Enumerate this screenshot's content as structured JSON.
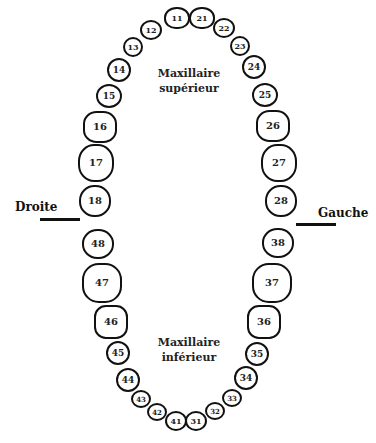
{
  "diagram": {
    "type": "dental-chart",
    "labels": {
      "upper_jaw_line1": "Maxillaire",
      "upper_jaw_line2": "supérieur",
      "lower_jaw_line1": "Maxillaire",
      "lower_jaw_line2": "inférieur",
      "right_side": "Droite",
      "left_side": "Gauche"
    },
    "colors": {
      "outline": "#111111",
      "text": "#222222",
      "background": "#ffffff"
    },
    "upper_teeth": [
      {
        "num": "11",
        "x": 177,
        "y": 18,
        "w": 26,
        "h": 22,
        "r": "48% 48% 45% 45%"
      },
      {
        "num": "21",
        "x": 202,
        "y": 18,
        "w": 26,
        "h": 22,
        "r": "48% 48% 45% 45%"
      },
      {
        "num": "12",
        "x": 151,
        "y": 30,
        "w": 22,
        "h": 20,
        "r": "50%"
      },
      {
        "num": "22",
        "x": 224,
        "y": 28,
        "w": 22,
        "h": 20,
        "r": "50%"
      },
      {
        "num": "13",
        "x": 133,
        "y": 47,
        "w": 20,
        "h": 20,
        "r": "50%"
      },
      {
        "num": "23",
        "x": 240,
        "y": 46,
        "w": 20,
        "h": 20,
        "r": "50%"
      },
      {
        "num": "14",
        "x": 119,
        "y": 70,
        "w": 24,
        "h": 24,
        "r": "50%"
      },
      {
        "num": "24",
        "x": 254,
        "y": 67,
        "w": 24,
        "h": 24,
        "r": "50%"
      },
      {
        "num": "15",
        "x": 109,
        "y": 96,
        "w": 26,
        "h": 24,
        "r": "50%"
      },
      {
        "num": "25",
        "x": 265,
        "y": 95,
        "w": 26,
        "h": 24,
        "r": "50%"
      },
      {
        "num": "16",
        "x": 100,
        "y": 127,
        "w": 34,
        "h": 32,
        "r": "40%"
      },
      {
        "num": "26",
        "x": 273,
        "y": 126,
        "w": 34,
        "h": 32,
        "r": "40%"
      },
      {
        "num": "17",
        "x": 96,
        "y": 163,
        "w": 36,
        "h": 38,
        "r": "45%"
      },
      {
        "num": "27",
        "x": 279,
        "y": 163,
        "w": 36,
        "h": 38,
        "r": "45%"
      },
      {
        "num": "18",
        "x": 95,
        "y": 201,
        "w": 32,
        "h": 32,
        "r": "48%"
      },
      {
        "num": "28",
        "x": 281,
        "y": 201,
        "w": 32,
        "h": 32,
        "r": "48%"
      }
    ],
    "lower_teeth": [
      {
        "num": "48",
        "x": 98,
        "y": 244,
        "w": 32,
        "h": 30,
        "r": "48%"
      },
      {
        "num": "38",
        "x": 278,
        "y": 243,
        "w": 32,
        "h": 30,
        "r": "48%"
      },
      {
        "num": "47",
        "x": 102,
        "y": 283,
        "w": 40,
        "h": 40,
        "r": "42%"
      },
      {
        "num": "37",
        "x": 272,
        "y": 283,
        "w": 40,
        "h": 40,
        "r": "42%"
      },
      {
        "num": "46",
        "x": 111,
        "y": 322,
        "w": 34,
        "h": 34,
        "r": "35%"
      },
      {
        "num": "36",
        "x": 264,
        "y": 322,
        "w": 34,
        "h": 34,
        "r": "35%"
      },
      {
        "num": "45",
        "x": 118,
        "y": 353,
        "w": 24,
        "h": 24,
        "r": "50%"
      },
      {
        "num": "35",
        "x": 257,
        "y": 354,
        "w": 24,
        "h": 24,
        "r": "50%"
      },
      {
        "num": "44",
        "x": 128,
        "y": 380,
        "w": 24,
        "h": 24,
        "r": "50%"
      },
      {
        "num": "34",
        "x": 246,
        "y": 378,
        "w": 24,
        "h": 24,
        "r": "50%"
      },
      {
        "num": "43",
        "x": 141,
        "y": 399,
        "w": 20,
        "h": 18,
        "r": "50%"
      },
      {
        "num": "33",
        "x": 232,
        "y": 398,
        "w": 20,
        "h": 18,
        "r": "50%"
      },
      {
        "num": "42",
        "x": 157,
        "y": 412,
        "w": 20,
        "h": 18,
        "r": "50%"
      },
      {
        "num": "32",
        "x": 215,
        "y": 411,
        "w": 20,
        "h": 18,
        "r": "50%"
      },
      {
        "num": "41",
        "x": 176,
        "y": 421,
        "w": 22,
        "h": 20,
        "r": "50%"
      },
      {
        "num": "31",
        "x": 196,
        "y": 421,
        "w": 22,
        "h": 20,
        "r": "50%"
      }
    ]
  }
}
